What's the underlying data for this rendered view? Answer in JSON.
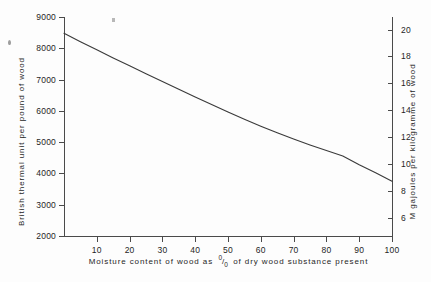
{
  "chart_data": {
    "type": "line",
    "title": "",
    "subtitle": "",
    "xlabel_parts": {
      "before": "Moisture  content  of  wood  as",
      "percent_numerator": "0",
      "percent_denominator": "0",
      "after": "of  dry  wood  substance  present"
    },
    "xlabel": "Moisture content of wood as % of dry wood substance present",
    "ylabel_left": "British  thermal  unit  per  pound  of  wood",
    "ylabel_right": "M  gajoules  per  kilogramme  of  wood",
    "xlim": [
      0,
      100
    ],
    "ylim_left": [
      2000,
      9000
    ],
    "ylim_right": [
      4.65,
      20.93
    ],
    "grid": false,
    "legend": "none",
    "x_ticks": [
      10,
      20,
      30,
      40,
      50,
      60,
      70,
      80,
      90,
      100
    ],
    "x_tick_labels": [
      "10",
      "20",
      "30",
      "40",
      "50",
      "60",
      "70",
      "80",
      "90",
      "100"
    ],
    "y_ticks_left": [
      2000,
      3000,
      4000,
      5000,
      6000,
      7000,
      8000,
      9000
    ],
    "y_tick_labels_left": [
      "2000",
      "3000",
      "4000",
      "5000",
      "6000",
      "7000",
      "8000",
      "9000"
    ],
    "y_ticks_right": [
      6,
      8,
      10,
      12,
      14,
      16,
      18,
      20
    ],
    "y_tick_labels_right": [
      "6",
      "8",
      "10",
      "12",
      "14",
      "16",
      "18",
      "20"
    ],
    "series": [
      {
        "name": "Calorific value of wood",
        "x": [
          0,
          5,
          10,
          15,
          20,
          25,
          30,
          35,
          40,
          45,
          50,
          55,
          60,
          65,
          70,
          75,
          80,
          85,
          90,
          95,
          100
        ],
        "values": [
          8480,
          8210,
          7950,
          7690,
          7440,
          7190,
          6940,
          6690,
          6440,
          6200,
          5960,
          5730,
          5510,
          5300,
          5100,
          4910,
          4730,
          4560,
          4280,
          4020,
          3750
        ],
        "values_right_axis": [
          19.72,
          19.09,
          18.49,
          17.88,
          17.3,
          16.72,
          16.14,
          15.56,
          14.98,
          14.42,
          13.86,
          13.32,
          12.81,
          12.32,
          11.86,
          11.42,
          11.0,
          10.6,
          9.95,
          9.35,
          8.72
        ],
        "color": "#3a3a3a"
      }
    ]
  }
}
